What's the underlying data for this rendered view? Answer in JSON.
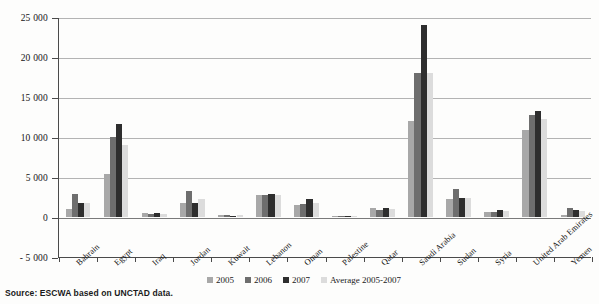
{
  "source_note": "Source: ESCWA based on UNCTAD data.",
  "legend": {
    "position": "bottom-center",
    "items": [
      {
        "label": "2005",
        "color": "#a8a8a8"
      },
      {
        "label": "2006",
        "color": "#6e6e6e"
      },
      {
        "label": "2007",
        "color": "#2e2e2e"
      },
      {
        "label": "Average 2005-2007",
        "color": "#dcdcdc"
      }
    ]
  },
  "axis": {
    "y_ticks": [
      "25 000",
      "20 000",
      "15 000",
      "10 000",
      "5 000",
      "0",
      "- 5 000"
    ],
    "y_tick_values": [
      25000,
      20000,
      15000,
      10000,
      5000,
      0,
      -5000
    ]
  },
  "chart_data": {
    "type": "bar",
    "title": "",
    "subtitle": "",
    "xlabel": "",
    "ylabel": "",
    "ylim": [
      -5000,
      25000
    ],
    "grid": true,
    "legend_position": "bottom-center",
    "categories": [
      "Bahrain",
      "Egypt",
      "Iraq",
      "Jordan",
      "Kuwait",
      "Lebanon",
      "Oman",
      "Palestine",
      "Qatar",
      "Saudi Arabia",
      "Sudan",
      "Syria",
      "United Arab Emirates",
      "Yemen"
    ],
    "series": [
      {
        "name": "2005",
        "color": "#a8a8a8",
        "values": [
          1050,
          5400,
          500,
          1800,
          250,
          2800,
          1500,
          50,
          1100,
          12000,
          2300,
          600,
          10900,
          300
        ]
      },
      {
        "name": "2006",
        "color": "#6e6e6e",
        "values": [
          2900,
          10000,
          350,
          3200,
          200,
          2750,
          1600,
          30,
          900,
          18000,
          3500,
          650,
          12800,
          1100
        ]
      },
      {
        "name": "2007",
        "color": "#2e2e2e",
        "values": [
          1750,
          11600,
          450,
          1800,
          130,
          2850,
          2200,
          20,
          1100,
          24000,
          2400,
          900,
          13200,
          900
        ]
      },
      {
        "name": "Average 2005-2007",
        "color": "#dcdcdc",
        "values": [
          1800,
          9000,
          430,
          2270,
          190,
          2800,
          1760,
          35,
          1050,
          18000,
          2400,
          720,
          12300,
          770
        ]
      }
    ]
  }
}
